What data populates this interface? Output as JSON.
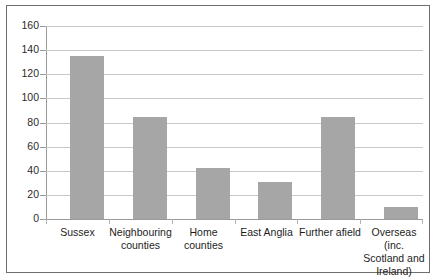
{
  "chart_data": {
    "type": "bar",
    "title": "",
    "subtitle": "",
    "xlabel": "",
    "ylabel": "",
    "ylim": [
      0,
      160
    ],
    "ytick_step": 20,
    "yticks": [
      160,
      140,
      120,
      100,
      80,
      60,
      40,
      20,
      0
    ],
    "ytick_labels": [
      "160",
      "140",
      "120",
      "100",
      "80",
      "60",
      "40",
      "20",
      "0"
    ],
    "grid": true,
    "legend": false,
    "legend_position": "none",
    "categories": [
      "Sussex",
      "Neighbouring counties",
      "Home counties",
      "East Anglia",
      "Further afield",
      "Overseas (inc. Scotland and Ireland)"
    ],
    "category_label_lines": [
      [
        "Sussex"
      ],
      [
        "Neighbouring",
        "counties"
      ],
      [
        "Home",
        "counties"
      ],
      [
        "East Anglia"
      ],
      [
        "Further afield"
      ],
      [
        "Overseas (inc.",
        "Scotland and",
        "Ireland)"
      ]
    ],
    "values": [
      135,
      85,
      42,
      31,
      85,
      10
    ],
    "series": [
      {
        "name": "Responses",
        "values": [
          135,
          85,
          42,
          31,
          85,
          10
        ]
      }
    ],
    "colors": {
      "bar_fill": "#a6a6a6",
      "gridline": "#c8c8c8",
      "axis": "#9a9a9a",
      "border": "#6e6e6e",
      "background": "#ffffff",
      "text": "#1d1d1d"
    }
  }
}
